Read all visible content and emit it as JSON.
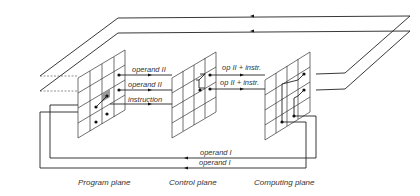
{
  "diagram": {
    "type": "three-plane wiring schematic",
    "planes": [
      {
        "id": "program",
        "caption": "Program plane"
      },
      {
        "id": "control",
        "caption": "Control plane"
      },
      {
        "id": "computing",
        "caption": "Computing plane"
      }
    ],
    "signals": {
      "operand2_top": "operand II",
      "operand2_mid": "operand II",
      "instruction": "instruction",
      "op2instr_top": "op II + instr.",
      "op2instr_mid": "op II + instr.",
      "operand1_top": "operand I",
      "operand1_bottom": "operand I"
    },
    "colors": {
      "line": "#222222",
      "background": "#ffffff",
      "highlight": "#999999"
    }
  }
}
